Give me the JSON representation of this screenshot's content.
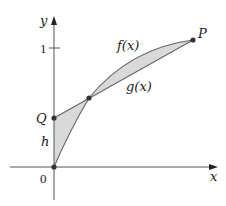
{
  "diagram": {
    "type": "function-graph",
    "axes": {
      "x_label": "x",
      "y_label": "y",
      "origin_label": "0",
      "y_tick_label": "1"
    },
    "curves": {
      "f_label": "f(x)",
      "g_label": "g(x)"
    },
    "points": {
      "P_label": "P",
      "Q_label": "Q"
    },
    "region_label": "h",
    "colors": {
      "axis": "#555555",
      "curve": "#666666",
      "fill": "#d9d9d9",
      "point": "#333333",
      "text": "#222222"
    }
  }
}
